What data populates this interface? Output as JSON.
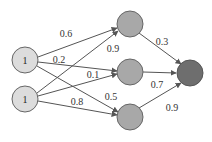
{
  "diagram": {
    "type": "neural-network",
    "colors": {
      "input_fill": "#dcdcdc",
      "hidden_fill": "#a8a8a8",
      "output_fill": "#6e6e6e",
      "stroke": "#555555",
      "edge": "#555555"
    },
    "nodes": [
      {
        "id": "in1",
        "layer": "input",
        "label": "1",
        "cx": 25,
        "cy": 60,
        "r": 13
      },
      {
        "id": "in2",
        "layer": "input",
        "label": "1",
        "cx": 25,
        "cy": 99,
        "r": 13
      },
      {
        "id": "h1",
        "layer": "hidden",
        "label": "",
        "cx": 130,
        "cy": 24,
        "r": 13
      },
      {
        "id": "h2",
        "layer": "hidden",
        "label": "",
        "cx": 130,
        "cy": 72,
        "r": 13
      },
      {
        "id": "h3",
        "layer": "hidden",
        "label": "",
        "cx": 130,
        "cy": 117,
        "r": 13
      },
      {
        "id": "out",
        "layer": "output",
        "label": "",
        "cx": 190,
        "cy": 73,
        "r": 13
      }
    ],
    "edges": [
      {
        "from": "in1",
        "to": "h1",
        "weight": "0.6",
        "lx": 66,
        "ly": 37
      },
      {
        "from": "in1",
        "to": "h2",
        "weight": "0.2",
        "lx": 54,
        "ly": 62
      },
      {
        "from": "in1",
        "to": "h3",
        "weight": "0.5",
        "lx": 104,
        "ly": 99
      },
      {
        "from": "in2",
        "to": "h1",
        "weight": "0.9",
        "lx": 107,
        "ly": 51
      },
      {
        "from": "in2",
        "to": "h2",
        "weight": "0.1",
        "lx": 87,
        "ly": 78
      },
      {
        "from": "in2",
        "to": "h3",
        "weight": "0.8",
        "lx": 70,
        "ly": 105
      },
      {
        "from": "h1",
        "to": "out",
        "weight": "0.3",
        "lx": 156,
        "ly": 46
      },
      {
        "from": "h2",
        "to": "out",
        "weight": "0.7",
        "lx": 152,
        "ly": 88
      },
      {
        "from": "h3",
        "to": "out",
        "weight": "0.9",
        "lx": 165,
        "ly": 111
      }
    ]
  },
  "labels": {
    "in1": "1",
    "in2": "1",
    "w_in1_h1": "0.6",
    "w_in1_h2": "0.2",
    "w_in1_h3": "0.5",
    "w_in2_h1": "0.9",
    "w_in2_h2": "0.1",
    "w_in2_h3": "0.8",
    "w_h1_out": "0.3",
    "w_h2_out": "0.7",
    "w_h3_out": "0.9"
  }
}
